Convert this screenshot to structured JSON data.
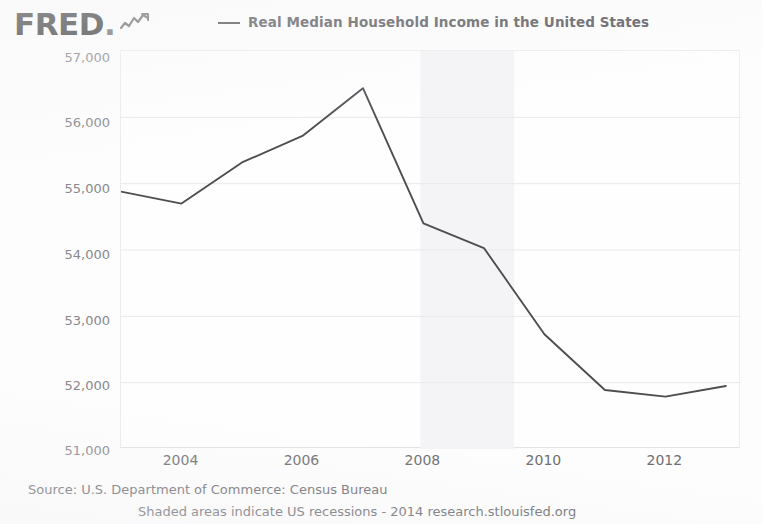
{
  "brand": {
    "wordmark": "FRED",
    "dot": ".",
    "squiggle_icon": "line-chart-squiggle"
  },
  "legend": {
    "series_label": "Real Median Household Income in the United States",
    "line_color": "#4e4e52"
  },
  "axes": {
    "y_title": "(2013 CPI-U-RS Adjusted Dollars)",
    "y_ticks": [
      "57,000",
      "56,000",
      "55,000",
      "54,000",
      "53,000",
      "52,000",
      "51,000"
    ],
    "x_ticks": [
      "2004",
      "2006",
      "2008",
      "2010",
      "2012"
    ]
  },
  "footer": {
    "source": "Source: U.S. Department of Commerce: Census Bureau",
    "note": "Shaded areas indicate US recessions - 2014 research.stlouisfed.org"
  },
  "chart_data": {
    "type": "line",
    "title": "Real Median Household Income in the United States",
    "xlabel": "",
    "ylabel": "(2013 CPI-U-RS Adjusted Dollars)",
    "x": [
      2003,
      2004,
      2005,
      2006,
      2007,
      2008,
      2009,
      2010,
      2011,
      2012,
      2013
    ],
    "values": [
      54880,
      54700,
      55320,
      55720,
      56440,
      54400,
      54030,
      52730,
      51890,
      51790,
      51950
    ],
    "series": [
      {
        "name": "Real Median Household Income in the United States",
        "values": [
          54880,
          54700,
          55320,
          55720,
          56440,
          54400,
          54030,
          52730,
          51890,
          51790,
          51950
        ]
      }
    ],
    "xlim": [
      2003,
      2013.25
    ],
    "ylim": [
      51000,
      57000
    ],
    "y_tick_values": [
      57000,
      56000,
      55000,
      54000,
      53000,
      52000,
      51000
    ],
    "x_tick_values": [
      2004,
      2006,
      2008,
      2010,
      2012
    ],
    "grid": true,
    "grid_color": "#e9e9ec",
    "legend_position": "top-center",
    "line_color": "#4e4e52",
    "shaded_regions": [
      {
        "label": "US recession",
        "x_start": 2007.95,
        "x_end": 2009.5,
        "color": "#f4f4f6"
      }
    ]
  }
}
